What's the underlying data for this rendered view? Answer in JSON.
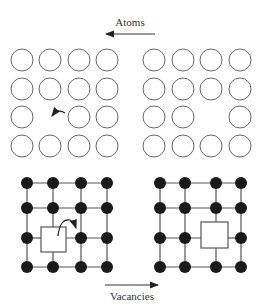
{
  "diagram": {
    "top_label": "Atoms",
    "top_arrow_direction": "left",
    "bottom_label": "Vacancies",
    "bottom_arrow_direction": "right",
    "colors": {
      "atom_outline": "#666666",
      "atom_fill": "#ffffff",
      "lattice_dot": "#1a1a1a",
      "lattice_line": "#555555",
      "vacancy_box": "#555555",
      "text": "#333333"
    },
    "atom_panels": [
      {
        "name": "atoms-before",
        "grid": "4x4",
        "missing": [
          [
            3,
            2
          ]
        ],
        "hop_arrow": true
      },
      {
        "name": "atoms-after",
        "grid": "4x4",
        "missing": [
          [
            3,
            3
          ]
        ],
        "hop_arrow": false
      }
    ],
    "lattice_panels": [
      {
        "name": "vacancy-before",
        "grid": "4x4",
        "vacancy": [
          3,
          2
        ],
        "hop_arrow": true
      },
      {
        "name": "vacancy-after",
        "grid": "4x4",
        "vacancy": [
          3,
          3
        ],
        "hop_arrow": false
      }
    ]
  }
}
